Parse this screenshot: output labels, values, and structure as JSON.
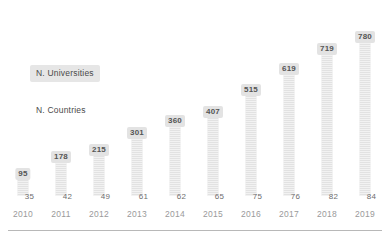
{
  "chart_data": {
    "type": "bar",
    "title": "",
    "xlabel": "",
    "ylabel": "",
    "grid": false,
    "legend_position": "inside-left",
    "ylim": [
      0,
      860
    ],
    "categories": [
      "2010",
      "2011",
      "2012",
      "2013",
      "2014",
      "2015",
      "2016",
      "2017",
      "2018",
      "2019"
    ],
    "series": [
      {
        "name": "N. Universities",
        "type": "bar",
        "values": [
          95,
          178,
          215,
          301,
          360,
          407,
          515,
          619,
          719,
          780
        ]
      },
      {
        "name": "N. Countries",
        "type": "label",
        "values": [
          35,
          42,
          49,
          61,
          62,
          65,
          75,
          76,
          82,
          84
        ]
      }
    ]
  },
  "legend": {
    "universities": "N. Universities",
    "countries": "N. Countries"
  },
  "colors": {
    "bar_fill": "#e2e2e2",
    "label_box": "#e3e3e3",
    "label_text": "#555555",
    "axis_text": "#9a9a9a",
    "country_text": "#6e6e6e",
    "rule": "#b8b8b8",
    "background": "#ffffff"
  }
}
